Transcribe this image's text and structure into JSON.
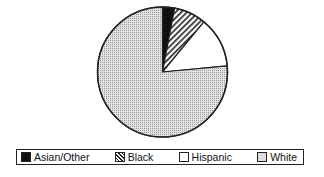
{
  "chart_data": {
    "type": "pie",
    "title": "",
    "categories": [
      "Asian/Other",
      "Black",
      "Hispanic",
      "White"
    ],
    "values": [
      3,
      8,
      12.5,
      76.5
    ],
    "unit": "percent (estimated from slice angles)",
    "start_angle": "12 o'clock, clockwise",
    "fills": [
      "solid-black",
      "diagonal-hatch",
      "white",
      "light-dotted-gray"
    ],
    "legend_position": "bottom"
  },
  "legend": {
    "items": [
      {
        "label": "Asian/Other",
        "fill": "solid"
      },
      {
        "label": "Black",
        "fill": "hatch"
      },
      {
        "label": "Hispanic",
        "fill": "blank"
      },
      {
        "label": "White",
        "fill": "dots"
      }
    ]
  },
  "colors": {
    "outline": "#222222",
    "solid": "#111111",
    "dots_bg": "#dddddd"
  }
}
